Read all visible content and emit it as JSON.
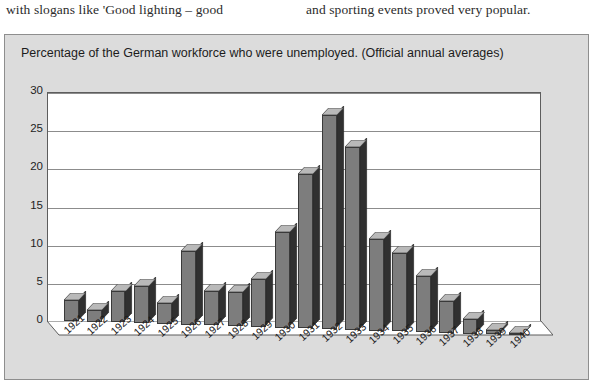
{
  "page_text": {
    "left_column_line": "with slogans like 'Good lighting – good",
    "right_column_line": "and sporting events proved very popular."
  },
  "figure": {
    "caption": "Percentage of the German workforce who were unemployed. (Official annual averages)",
    "background_color": "#dcdcdc",
    "border_color": "#8e8e8e"
  },
  "chart_data": {
    "type": "bar",
    "title": "Percentage of the German workforce who were unemployed. (Official annual averages)",
    "xlabel": "",
    "ylabel": "",
    "ylim": [
      0,
      30
    ],
    "yticks": [
      0,
      5,
      10,
      15,
      20,
      25,
      30
    ],
    "grid": true,
    "legend": "none",
    "style": "3d-column",
    "bar_face_color": "#7d7d7d",
    "bar_side_color": "#303030",
    "bar_top_color": "#b9b9b9",
    "plot_background": "#ffffff",
    "categories": [
      "1921",
      "1922",
      "1923",
      "1924",
      "1925",
      "1926",
      "1927",
      "1928",
      "1929",
      "1930",
      "1931",
      "1932",
      "1933",
      "1934",
      "1935",
      "1936",
      "1937",
      "1938",
      "1939",
      "1940"
    ],
    "values": [
      2.8,
      1.5,
      4.1,
      4.9,
      2.8,
      9.6,
      4.5,
      4.5,
      6.3,
      12.5,
      20.2,
      28.0,
      24.0,
      12.0,
      10.3,
      7.4,
      4.1,
      1.9,
      0.5,
      0.2
    ]
  }
}
